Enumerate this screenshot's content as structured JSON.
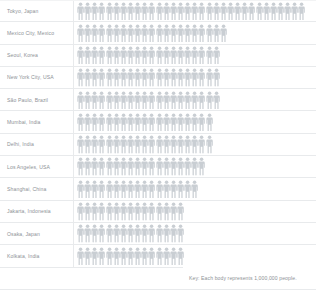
{
  "chart_data": {
    "type": "bar",
    "subtype": "pictogram",
    "title": "",
    "xlabel": "",
    "ylabel": "",
    "unit_label": "millions of people",
    "unit_value": 1000000,
    "key": "Key: Each body represents 1,000,000 people.",
    "icon": "person-figure",
    "categories": [
      "Tokyo, Japan",
      "Mexico City, Mexico",
      "Seoul, Korea",
      "New York City, USA",
      "São Paulo, Brazil",
      "Mumbai, India",
      "Delhi, India",
      "Los Angeles, USA",
      "Shanghai, China",
      "Jakarta, Indonesia",
      "Osaka, Japan",
      "Kolkata, India"
    ],
    "values": [
      32,
      21,
      20,
      20,
      20,
      19,
      19,
      18,
      17,
      15,
      15,
      15
    ],
    "grid": false,
    "legend": "bottom-right"
  },
  "rows": [
    {
      "label": "Tokyo, Japan",
      "count": 32
    },
    {
      "label": "Mexico City, Mexico",
      "count": 21
    },
    {
      "label": "Seoul, Korea",
      "count": 20
    },
    {
      "label": "New York City, USA",
      "count": 20
    },
    {
      "label": "São Paulo, Brazil",
      "count": 20
    },
    {
      "label": "Mumbai, India",
      "count": 19
    },
    {
      "label": "Delhi, India",
      "count": 19
    },
    {
      "label": "Los Angeles, USA",
      "count": 18
    },
    {
      "label": "Shanghai, China",
      "count": 17
    },
    {
      "label": "Jakarta, Indonesia",
      "count": 15
    },
    {
      "label": "Osaka, Japan",
      "count": 15
    },
    {
      "label": "Kolkata, India",
      "count": 15
    }
  ],
  "key": {
    "text": "Key: Each body represents 1,000,000 people."
  },
  "colors": {
    "figure": "#c9ced3",
    "text": "#8d9196",
    "rule": "#e8eaec",
    "background": "#ffffff"
  }
}
